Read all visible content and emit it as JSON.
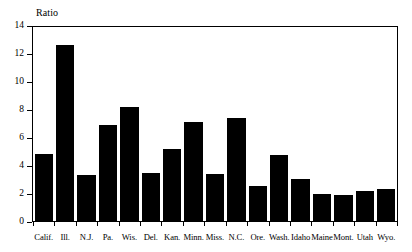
{
  "chart_data": {
    "type": "bar",
    "title": "",
    "subtitle": "",
    "xlabel": "",
    "ylabel": "Ratio",
    "ylim": [
      0,
      14
    ],
    "yticks": [
      0,
      2,
      4,
      6,
      8,
      10,
      12,
      14
    ],
    "ytick_labels": [
      "0",
      "2",
      "4",
      "6",
      "8",
      "10",
      "12",
      "14"
    ],
    "grid": false,
    "legend": "none",
    "bar_color": "#000000",
    "frame_color": "#000000",
    "background_color": "#ffffff",
    "categories": [
      "Calif.",
      "Ill.",
      "N.J.",
      "Pa.",
      "Wis.",
      "Del.",
      "Kan.",
      "Minn.",
      "Miss.",
      "N.C.",
      "Ore.",
      "Wash.",
      "Idaho",
      "Maine",
      "Mont.",
      "Utah",
      "Wyo."
    ],
    "values": [
      4.85,
      12.7,
      3.3,
      6.9,
      8.2,
      3.45,
      5.2,
      7.15,
      3.4,
      7.45,
      2.5,
      4.75,
      3.0,
      1.95,
      1.9,
      2.15,
      2.3
    ]
  }
}
